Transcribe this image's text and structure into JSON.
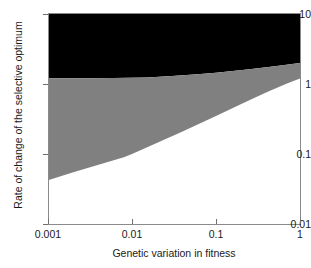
{
  "chart_data": {
    "type": "area",
    "title": "",
    "subtitle": "",
    "xlabel": "Genetic variation in fitness",
    "ylabel": "Rate of change of the selective optimum",
    "xscale": "log",
    "yscale": "log",
    "xlim": [
      0.001,
      1
    ],
    "ylim": [
      0.01,
      10
    ],
    "xticks": [
      0.001,
      0.01,
      0.1,
      1
    ],
    "xtick_labels": [
      "0.001",
      "0.01",
      "0.1",
      "1"
    ],
    "yticks": [
      0.01,
      0.1,
      1,
      10
    ],
    "ytick_labels": [
      "0.01",
      "0.1",
      "1",
      "10"
    ],
    "grid": false,
    "legend": "none",
    "colors": {
      "upper_region": "#000000",
      "middle_region": "#808080",
      "lower_region": "#ffffff",
      "axis": "#8a8a8a",
      "text": "#1a1a1a"
    },
    "series": [
      {
        "name": "upper boundary (black / grey interface)",
        "x": [
          0.001,
          0.0025,
          0.006,
          0.015,
          0.03,
          0.06,
          0.1,
          0.25,
          0.5,
          1
        ],
        "values": [
          1.21,
          1.21,
          1.22,
          1.24,
          1.3,
          1.38,
          1.45,
          1.62,
          1.8,
          2.0
        ]
      },
      {
        "name": "lower boundary (grey / white interface)",
        "x": [
          0.001,
          0.002,
          0.004,
          0.008,
          0.01,
          0.02,
          0.04,
          0.1,
          0.2,
          0.4,
          0.7,
          1
        ],
        "values": [
          0.042,
          0.055,
          0.07,
          0.09,
          0.1,
          0.145,
          0.21,
          0.35,
          0.52,
          0.76,
          1.02,
          1.2
        ]
      }
    ],
    "regions": [
      {
        "name": "black region",
        "fill": "#000000",
        "between": [
          "upper boundary",
          "ylim top"
        ]
      },
      {
        "name": "grey region",
        "fill": "#808080",
        "between": [
          "lower boundary",
          "upper boundary"
        ]
      },
      {
        "name": "white region",
        "fill": "#ffffff",
        "between": [
          "ylim bottom",
          "lower boundary"
        ]
      }
    ]
  },
  "axes": {
    "x": {
      "title": "Genetic variation in fitness",
      "ticks": [
        {
          "label": "0.001",
          "value": 0.001
        },
        {
          "label": "0.01",
          "value": 0.01
        },
        {
          "label": "0.1",
          "value": 0.1
        },
        {
          "label": "1",
          "value": 1
        }
      ]
    },
    "y": {
      "title": "Rate of change of the selective optimum",
      "ticks": [
        {
          "label": "10",
          "value": 10
        },
        {
          "label": "1",
          "value": 1
        },
        {
          "label": "0.1",
          "value": 0.1
        },
        {
          "label": "0.01",
          "value": 0.01
        }
      ]
    }
  }
}
